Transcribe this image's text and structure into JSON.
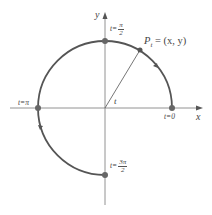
{
  "diagram": {
    "axes": {
      "x_label": "x",
      "y_label": "y"
    },
    "point_label": "Pₜ = (x, y)",
    "point_label_parts": {
      "P": "P",
      "sub": "t",
      "rest": " = (x, y)"
    },
    "angle_label": "t",
    "markers": [
      {
        "name": "t0",
        "text": "t=0"
      },
      {
        "name": "t-pi-half",
        "prefix": "t=",
        "num": "π",
        "den": "2"
      },
      {
        "name": "t-pi",
        "text": "t=π"
      },
      {
        "name": "t-3pi-half",
        "prefix": "t=",
        "num": "3π",
        "den": "2"
      }
    ],
    "colors": {
      "curve": "#555555",
      "axis": "#666666",
      "point": "#555555",
      "text": "#444444"
    }
  }
}
